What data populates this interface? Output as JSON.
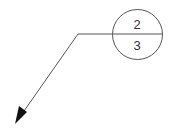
{
  "callout": {
    "type": "section-detail-marker",
    "top_label": "2",
    "bottom_label": "3",
    "stroke_color": "#555555",
    "text_color": "#333333",
    "arrow_color": "#111111"
  }
}
